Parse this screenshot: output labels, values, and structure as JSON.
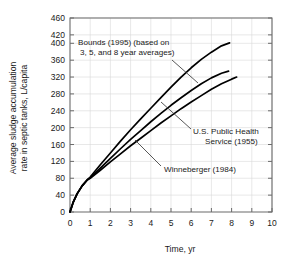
{
  "chart_data": {
    "type": "line",
    "title": "",
    "xlabel": "Time, yr",
    "ylabel": "Average sludge accumulation rate in septic tanks, L/capita",
    "ylabel_line1": "Average sludge accumulation",
    "ylabel_line2": "rate in septic tanks, L/capita",
    "xlim": [
      0,
      10
    ],
    "ylim": [
      0,
      460
    ],
    "xticks": [
      0,
      1,
      2,
      3,
      4,
      5,
      6,
      7,
      8,
      9,
      10
    ],
    "yticks": [
      0,
      40,
      80,
      120,
      160,
      200,
      240,
      280,
      320,
      360,
      400,
      420,
      460
    ],
    "ytick_labels": [
      "0",
      "40",
      "80",
      "120",
      "160",
      "200",
      "240",
      "280",
      "320",
      "360",
      "400",
      "420",
      "460"
    ],
    "xtick_labels": [
      "0",
      "1",
      "2",
      "3",
      "4",
      "5",
      "6",
      "7",
      "8",
      "9",
      "10"
    ],
    "grid": true,
    "grid_color": "#d8d8d8",
    "axis_color": "#6b6b6b",
    "line_color": "#000000",
    "legend_position": "inline-annotations",
    "series": [
      {
        "name": "Bounds (1995) (based on 3, 5, and 8 year averages)",
        "label_line1": "Bounds (1995) (based on",
        "label_line2": "3, 5, and 8 year averages)",
        "x": [
          0,
          0.15,
          0.35,
          0.6,
          0.85,
          1.0,
          1.5,
          2.0,
          2.5,
          3.0,
          3.5,
          4.0,
          4.5,
          5.0,
          5.5,
          6.0,
          6.5,
          7.0,
          7.5,
          7.9
        ],
        "y": [
          0,
          22,
          43,
          62,
          76,
          83,
          112,
          140,
          168,
          195,
          221,
          246,
          271,
          296,
          320,
          342,
          362,
          379,
          394,
          401
        ]
      },
      {
        "name": "U.S. Public Health Service (1955)",
        "label_line1": "U.S. Public Health",
        "label_line2": "Service (1955)",
        "x": [
          0,
          0.15,
          0.35,
          0.6,
          0.85,
          1.0,
          1.5,
          2.0,
          2.5,
          3.0,
          3.5,
          4.0,
          4.5,
          5.0,
          5.5,
          6.0,
          6.5,
          7.0,
          7.5,
          7.85
        ],
        "y": [
          0,
          22,
          43,
          62,
          76,
          81,
          104,
          127,
          150,
          172,
          193,
          214,
          234,
          253,
          271,
          288,
          304,
          318,
          329,
          334
        ]
      },
      {
        "name": "Winneberger (1984)",
        "label_line1": "Winneberger (1984)",
        "label_line2": "",
        "x": [
          0,
          0.15,
          0.35,
          0.6,
          0.85,
          1.0,
          1.5,
          2.0,
          2.5,
          3.0,
          3.5,
          4.0,
          4.5,
          5.0,
          5.5,
          6.0,
          6.5,
          7.0,
          7.5,
          8.0,
          8.25
        ],
        "y": [
          0,
          22,
          43,
          62,
          76,
          80,
          99,
          119,
          138,
          157,
          175,
          193,
          211,
          228,
          245,
          261,
          276,
          291,
          304,
          315,
          320
        ]
      }
    ],
    "annotations": [
      {
        "id": "bounds",
        "line1": "Bounds (1995) (based on",
        "line2": "3, 5, and 8 year averages)",
        "text_x": 78,
        "text_y": 45,
        "leader": {
          "x1": 172,
          "y1": 60,
          "x2": 198,
          "y2": 83
        }
      },
      {
        "id": "usphs",
        "line1": "U.S. Public Health",
        "line2": "Service (1955)",
        "text_x": 193,
        "text_y": 134,
        "leader": {
          "x1": 191,
          "y1": 129,
          "x2": 161,
          "y2": 102
        }
      },
      {
        "id": "winneberger",
        "line1": "Winneberger (1984)",
        "line2": "",
        "text_x": 164,
        "text_y": 172,
        "leader": {
          "x1": 161,
          "y1": 166,
          "x2": 135,
          "y2": 140
        }
      }
    ]
  },
  "colors": {
    "line": "#000000",
    "grid": "#d8d8d8",
    "axis": "#6b6b6b",
    "text": "#1a1a1a",
    "background": "#ffffff"
  }
}
